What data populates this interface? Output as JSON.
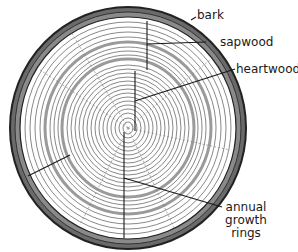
{
  "diagram": {
    "labels": {
      "bark": "bark",
      "sapwood": "sapwood",
      "heartwood": "heartwood",
      "annual_growth_rings_line1": "annual",
      "annual_growth_rings_line2": "growth",
      "annual_growth_rings_line3": "rings"
    },
    "colors": {
      "ink": "#1a1a1a",
      "bark": "#3a3a3a",
      "dark_ring": "#9a9a9a",
      "background": "#ffffff"
    }
  }
}
